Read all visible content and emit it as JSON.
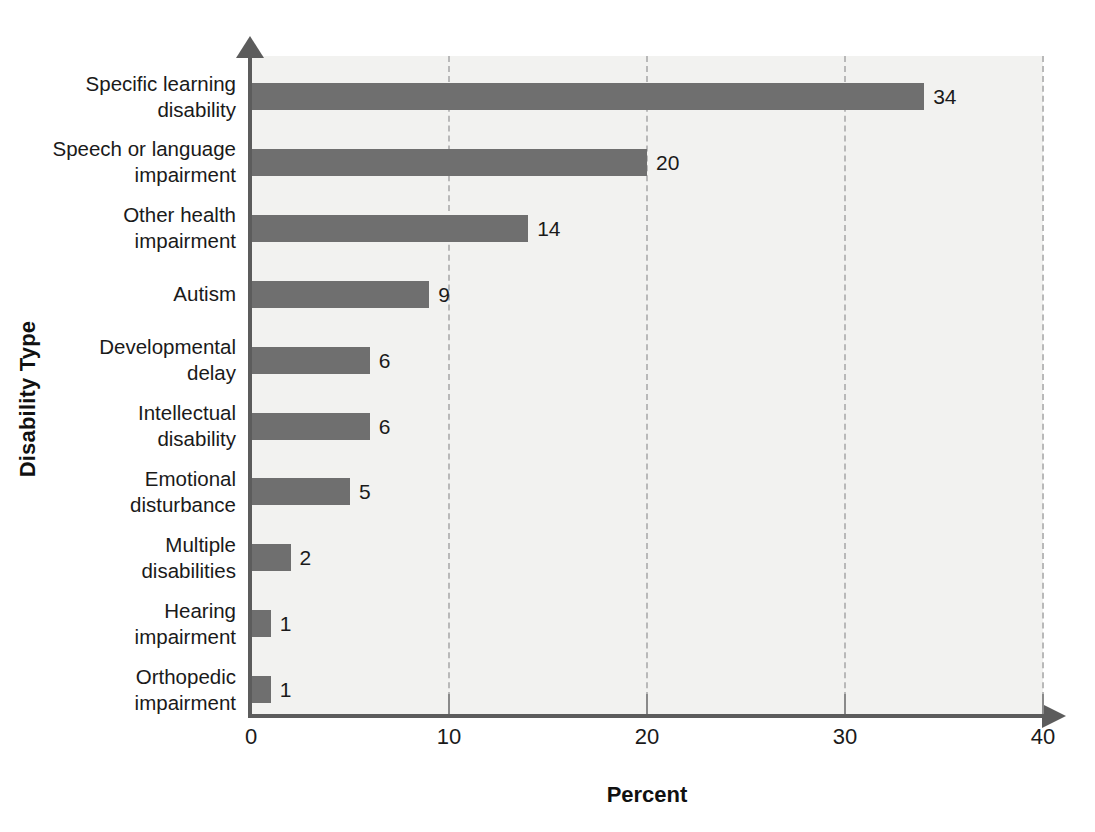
{
  "chart_data": {
    "type": "bar",
    "orientation": "horizontal",
    "title": "",
    "xlabel": "Percent",
    "ylabel": "Disability Type",
    "xlim": [
      0,
      40
    ],
    "xticks": [
      0,
      10,
      20,
      30,
      40
    ],
    "xtick_labels": [
      "0",
      "10",
      "20",
      "30",
      "40"
    ],
    "grid": true,
    "grid_style": "dashed-vertical",
    "legend": "none",
    "categories": [
      "Specific learning disability",
      "Speech or language impairment",
      "Other health impairment",
      "Autism",
      "Developmental delay",
      "Intellectual disability",
      "Emotional disturbance",
      "Multiple disabilities",
      "Hearing impairment",
      "Orthopedic impairment"
    ],
    "values": [
      34,
      20,
      14,
      9,
      6,
      6,
      5,
      2,
      1,
      1
    ],
    "value_labels": [
      "34",
      "20",
      "14",
      "9",
      "6",
      "6",
      "5",
      "2",
      "1",
      "1"
    ],
    "bar_color": "#6f6f6f",
    "plot_background": "#f2f2f0",
    "axis_color": "#5c5c5c",
    "gridline_color": "#b9b9b9"
  },
  "category_label_lines": [
    [
      "Specific learning",
      "disability"
    ],
    [
      "Speech or language",
      "impairment"
    ],
    [
      "Other health",
      "impairment"
    ],
    [
      "Autism"
    ],
    [
      "Developmental",
      "delay"
    ],
    [
      "Intellectual",
      "disability"
    ],
    [
      "Emotional",
      "disturbance"
    ],
    [
      "Multiple",
      "disabilities"
    ],
    [
      "Hearing",
      "impairment"
    ],
    [
      "Orthopedic",
      "impairment"
    ]
  ]
}
